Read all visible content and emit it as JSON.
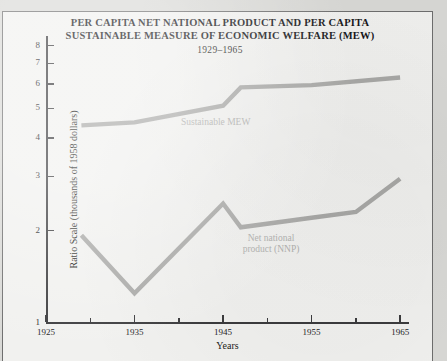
{
  "figure": {
    "title_lines": [
      "PER CAPITA NET NATIONAL PRODUCT AND PER CAPITA",
      "SUSTAINABLE MEASURE OF ECONOMIC WELFARE (MEW)"
    ],
    "subtitle": "1929–1965",
    "background_color": "#f1f1ef",
    "margin_color": "#d9d9d6",
    "frame_color": "#6e6e6e",
    "axis_color": "#3b3b3d",
    "series_color": "#a9a9a7",
    "annotation_color": "#b0b0ae"
  },
  "chart_data": {
    "type": "line",
    "title": "PER CAPITA NET NATIONAL PRODUCT AND PER CAPITA SUSTAINABLE MEASURE OF ECONOMIC WELFARE (MEW)",
    "subtitle": "1929–1965",
    "xlabel": "Years",
    "ylabel": "Ratio Scale (thousands of 1958 dollars)",
    "yscale": "log",
    "ylim": [
      1,
      8.6
    ],
    "xlim": [
      1925,
      1966
    ],
    "grid": false,
    "legend": "inline-annotations",
    "ytick_labels": [
      "1",
      "2",
      "3",
      "4",
      "5",
      "6",
      "7",
      "8"
    ],
    "ytick_values": [
      1,
      2,
      3,
      4,
      5,
      6,
      7,
      8
    ],
    "xtick_labels": [
      "1925",
      "1935",
      "1945",
      "1955",
      "1965"
    ],
    "xtick_values": [
      1925,
      1935,
      1945,
      1955,
      1965
    ],
    "xtick_minor_values": [
      1930,
      1940,
      1950,
      1960
    ],
    "series": [
      {
        "name": "Sustainable MEW",
        "label": "Sustainable MEW",
        "x": [
          1929,
          1935,
          1945,
          1947,
          1955,
          1965
        ],
        "values": [
          4.4,
          4.5,
          5.1,
          5.85,
          5.95,
          6.3
        ]
      },
      {
        "name": "Net national product (NNP)",
        "label_lines": [
          "Net national",
          "product (NNP)"
        ],
        "x": [
          1929,
          1935,
          1945,
          1947,
          1955,
          1960,
          1965
        ],
        "values": [
          1.93,
          1.25,
          2.45,
          2.05,
          2.2,
          2.3,
          2.95
        ]
      }
    ]
  }
}
